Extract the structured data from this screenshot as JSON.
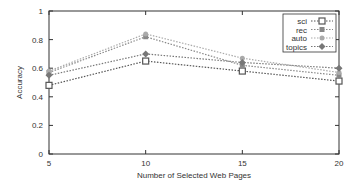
{
  "chart_data": {
    "type": "line",
    "title": "",
    "xlabel": "Number of Selected Web Pages",
    "ylabel": "Accuracy",
    "x": [
      5,
      10,
      15,
      20
    ],
    "xlim": [
      5,
      20
    ],
    "ylim": [
      0,
      1
    ],
    "xticks": [
      5,
      10,
      15,
      20
    ],
    "yticks": [
      0,
      0.2,
      0.4,
      0.6,
      0.8,
      1
    ],
    "ytick_labels": [
      "0",
      "0.2",
      "0.4",
      "0.6",
      "0.8",
      "1"
    ],
    "grid": false,
    "legend_position": "top-right",
    "series": [
      {
        "name": "sci",
        "marker": "square-open",
        "values": [
          0.48,
          0.65,
          0.58,
          0.51
        ]
      },
      {
        "name": "rec",
        "marker": "square-filled",
        "values": [
          0.57,
          0.82,
          0.62,
          0.55
        ]
      },
      {
        "name": "auto",
        "marker": "circle-filled",
        "values": [
          0.58,
          0.84,
          0.67,
          0.57
        ]
      },
      {
        "name": "topics",
        "marker": "diamond-filled",
        "values": [
          0.55,
          0.7,
          0.64,
          0.6
        ]
      }
    ]
  },
  "colors": {
    "axis": "#333333",
    "sci": "#555555",
    "rec": "#888888",
    "auto": "#aaaaaa",
    "topics": "#777777"
  }
}
